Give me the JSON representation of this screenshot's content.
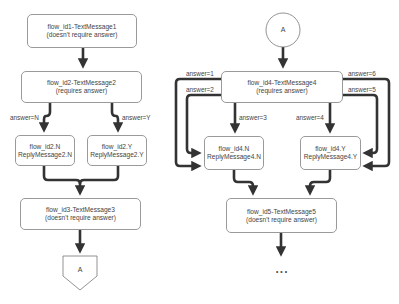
{
  "left_flow": {
    "box1": {
      "line1": "flow_id1-TextMessage1",
      "line2": "(doesn't require answer)"
    },
    "box2": {
      "line1": "flow_id2-TextMessage2",
      "line2": "(requires answer)"
    },
    "edge_n": "answer=N",
    "edge_y": "answer=Y",
    "box_n": {
      "line1": "flow_id2.N",
      "line2": "ReplyMessage2.N"
    },
    "box_y": {
      "line1": "flow_id2.Y",
      "line2": "ReplyMessage2.Y"
    },
    "box3": {
      "line1": "flow_id3-TextMessage3",
      "line2": "(doesn't require answer)"
    },
    "connector_out": "A"
  },
  "right_flow": {
    "connector_in": "A",
    "box4": {
      "line1": "flow_id4-TextMessage4",
      "line2": "(requires answer)"
    },
    "edges": {
      "a1": "answer=1",
      "a2": "answer=2",
      "a3": "answer=3",
      "a4": "answer=4",
      "a5": "answer=5",
      "a6": "answer=6"
    },
    "box_n": {
      "line1": "flow_id4.N",
      "line2": "ReplyMessage4.N"
    },
    "box_y": {
      "line1": "flow_id4.Y",
      "line2": "ReplyMessage4.Y"
    },
    "box5": {
      "line1": "flow_id5-TextMessage5",
      "line2": "(doesn't require answer)"
    },
    "continuation": "..."
  }
}
